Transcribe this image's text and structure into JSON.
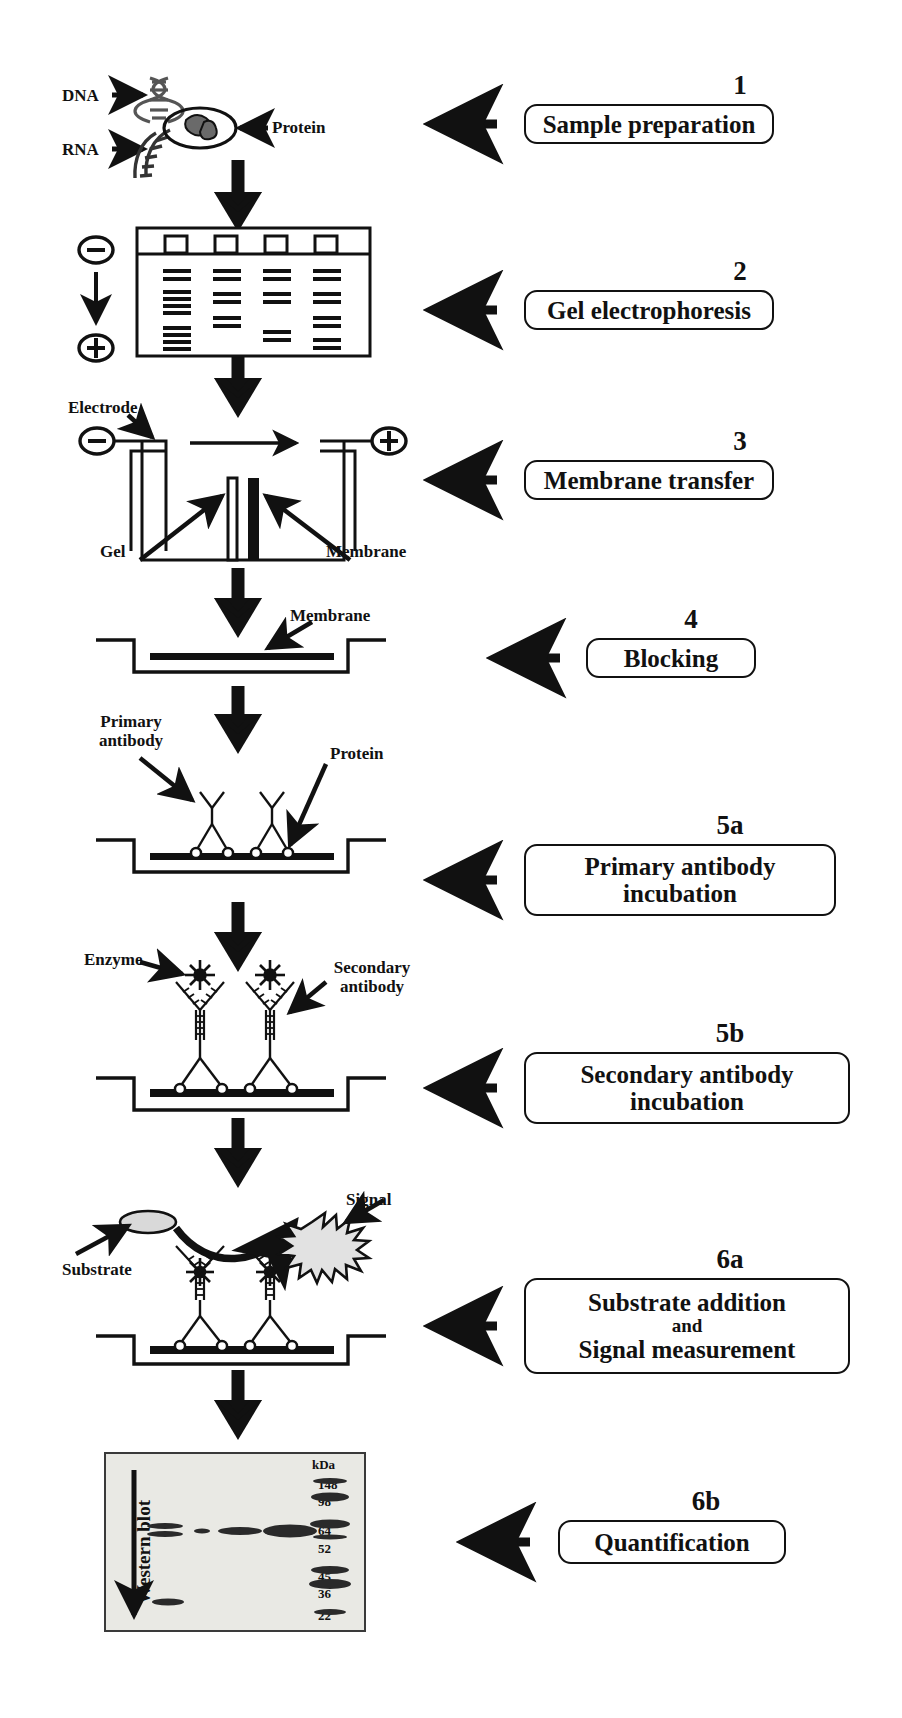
{
  "diagram": {
    "colors": {
      "ink": "#111111",
      "blot_bg": "#e9e9e4",
      "substrate_fill": "#d9d9d9"
    }
  },
  "steps": [
    {
      "number": "1",
      "label": "Sample preparation"
    },
    {
      "number": "2",
      "label": "Gel electrophoresis"
    },
    {
      "number": "3",
      "label": "Membrane transfer"
    },
    {
      "number": "4",
      "label": "Blocking"
    },
    {
      "number": "5a",
      "label_line1": "Primary antibody",
      "label_line2": "incubation"
    },
    {
      "number": "5b",
      "label_line1": "Secondary antibody",
      "label_line2": "incubation"
    },
    {
      "number": "6a",
      "label_line1": "Substrate addition",
      "label_line2": "and",
      "label_line3": "Signal measurement"
    },
    {
      "number": "6b",
      "label": "Quantification"
    }
  ],
  "panel1": {
    "dna_label": "DNA",
    "rna_label": "RNA",
    "protein_label": "Protein"
  },
  "panel2": {
    "minus_pole": "⊖",
    "plus_pole": "⊕",
    "lanes": 4
  },
  "panel3": {
    "electrode_label": "Electrode",
    "gel_label": "Gel",
    "membrane_label": "Membrane",
    "minus_pole": "⊖",
    "plus_pole": "⊕"
  },
  "panel4": {
    "membrane_label": "Membrane"
  },
  "panel5a": {
    "primary_antibody_label": "Primary\nantibody",
    "primary_antibody_line1": "Primary",
    "primary_antibody_line2": "antibody",
    "protein_label": "Protein"
  },
  "panel5b": {
    "enzyme_label": "Enzyme",
    "secondary_antibody_line1": "Secondary",
    "secondary_antibody_line2": "antibody"
  },
  "panel6a": {
    "substrate_label": "Substrate",
    "signal_label": "Signal"
  },
  "panel6b": {
    "axis_label": "Western blot",
    "unit_header": "kDa",
    "markers": [
      "148",
      "98",
      "64",
      "52",
      "45",
      "36",
      "22"
    ]
  }
}
